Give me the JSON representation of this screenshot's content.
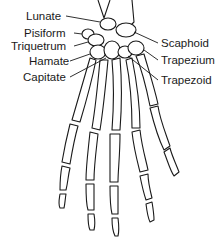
{
  "diagram": {
    "labels_left": [
      {
        "id": "lunate",
        "text": "Lunate",
        "x": 28,
        "y": 10
      },
      {
        "id": "pisiform",
        "text": "Pisiform",
        "x": 24,
        "y": 27
      },
      {
        "id": "triquetrum",
        "text": "Triquetrum",
        "x": 13,
        "y": 40
      },
      {
        "id": "hamate",
        "text": "Hamate",
        "x": 29,
        "y": 55
      },
      {
        "id": "capitate",
        "text": "Capitate",
        "x": 23,
        "y": 71
      }
    ],
    "labels_right": [
      {
        "id": "scaphoid",
        "text": "Scaphoid",
        "x": 161,
        "y": 37
      },
      {
        "id": "trapezium",
        "text": "Trapezium",
        "x": 161,
        "y": 54
      },
      {
        "id": "trapezoid",
        "text": "Trapezoid",
        "x": 161,
        "y": 74
      }
    ],
    "line_color": "#1a1a1a"
  }
}
